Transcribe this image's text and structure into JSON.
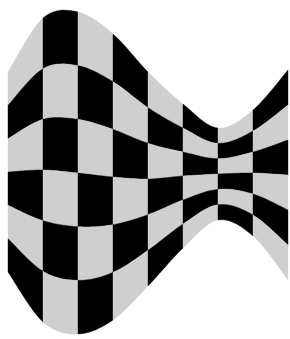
{
  "figure": {
    "columns": 8,
    "rows": 6,
    "colors": {
      "dark": "#000000",
      "light": "#cfcfcf",
      "background": "#ffffff"
    },
    "x_bounds": [
      8,
      43,
      78,
      113,
      148,
      183,
      218,
      253,
      288
    ],
    "top_edge_y": [
      72,
      18,
      12,
      34,
      72,
      104,
      128,
      110,
      70
    ],
    "bottom_edge_y": [
      272,
      322,
      334,
      320,
      286,
      248,
      220,
      236,
      280
    ],
    "first_cell_dark": false
  }
}
